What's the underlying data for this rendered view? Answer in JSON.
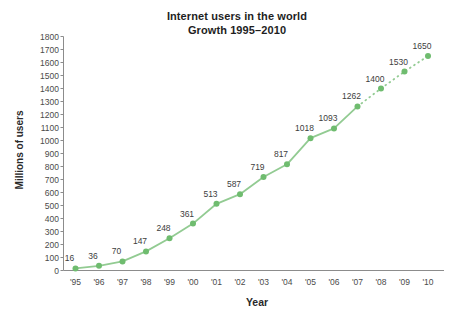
{
  "chart_data": {
    "type": "line",
    "title": "Internet users in the world",
    "subtitle": "Growth 1995–2010",
    "xlabel": "Year",
    "ylabel": "Millions of users",
    "categories": [
      "'95",
      "'96",
      "'97",
      "'98",
      "'99",
      "'00",
      "'01",
      "'02",
      "'03",
      "'04",
      "'05",
      "'06",
      "'07",
      "'08",
      "'09",
      "'10"
    ],
    "values": [
      16,
      36,
      70,
      147,
      248,
      361,
      513,
      587,
      719,
      817,
      1018,
      1093,
      1262,
      1400,
      1530,
      1650
    ],
    "data_labels": [
      "16",
      "36",
      "70",
      "147",
      "248",
      "361",
      "513",
      "587",
      "719",
      "817",
      "1018",
      "1093",
      "1262",
      "1400",
      "1530",
      "1650"
    ],
    "solid_through_index": 12,
    "projected_style": "dotted",
    "ylim": [
      0,
      1800
    ],
    "ytick_step": 100,
    "grid": "off",
    "legend": "none",
    "colors": {
      "line": "#92cb92",
      "point": "#6fbc6f",
      "axis": "#8c8c8c",
      "tick_text": "#4b4b4b",
      "data_label_text": "#3d3d3d",
      "title_text": "#1e1e1e"
    }
  }
}
